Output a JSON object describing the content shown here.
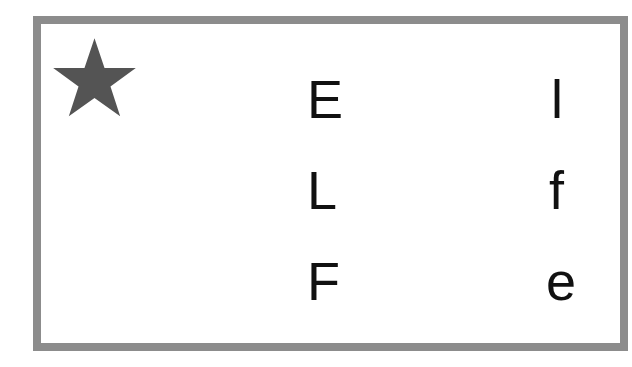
{
  "card": {
    "icon": "star-icon",
    "border_color": "#8c8c8c",
    "star_color": "#545454",
    "left_column": [
      "E",
      "L",
      "F"
    ],
    "right_column": [
      "l",
      "f",
      "e"
    ]
  }
}
